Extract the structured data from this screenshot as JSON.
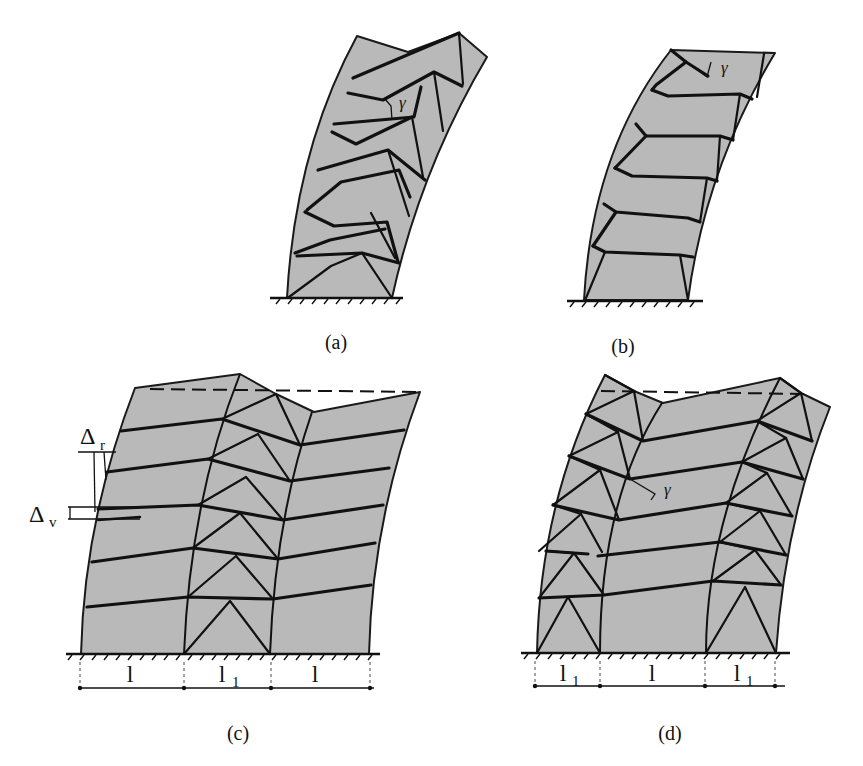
{
  "figure": {
    "colors": {
      "wall_fill": "#b9b9b9",
      "line": "#111111",
      "background": "#ffffff"
    },
    "panels": [
      {
        "id": "a",
        "caption": "(a)",
        "annotation": "γ"
      },
      {
        "id": "b",
        "caption": "(b)",
        "annotation": "γ"
      },
      {
        "id": "c",
        "caption": "(c)",
        "annotations": {
          "delta_r": "Δ",
          "delta_r_sub": "r",
          "delta_v": "Δ",
          "delta_v_sub": "v"
        },
        "dimensions": [
          {
            "label": "l",
            "sub": ""
          },
          {
            "label": "l",
            "sub": "1"
          },
          {
            "label": "l",
            "sub": ""
          }
        ]
      },
      {
        "id": "d",
        "caption": "(d)",
        "annotation": "γ",
        "dimensions": [
          {
            "label": "l",
            "sub": "1"
          },
          {
            "label": "l",
            "sub": ""
          },
          {
            "label": "l",
            "sub": "1"
          }
        ]
      }
    ]
  }
}
